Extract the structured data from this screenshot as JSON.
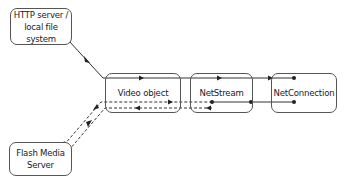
{
  "diagram": {
    "nodes": {
      "http": {
        "label": "HTTP server /\nlocal file system"
      },
      "fms": {
        "label": "Flash Media\nServer"
      },
      "video": {
        "label": "Video object"
      },
      "netstream": {
        "label": "NetStream"
      },
      "netconnection": {
        "label": "NetConnection"
      }
    },
    "edges": [
      {
        "from": "http",
        "to": "video",
        "style": "solid",
        "direction": "forward"
      },
      {
        "from": "video",
        "to": "netstream",
        "style": "solid",
        "direction": "forward"
      },
      {
        "from": "netstream",
        "to": "netconnection",
        "style": "solid",
        "direction": "forward"
      },
      {
        "from": "netconnection",
        "to": "netstream",
        "style": "solid",
        "direction": "return"
      },
      {
        "from": "fms",
        "to": "video",
        "style": "dashed",
        "direction": "forward"
      },
      {
        "from": "video",
        "to": "netstream",
        "style": "dashed",
        "direction": "forward"
      },
      {
        "from": "netstream",
        "to": "video",
        "style": "dashed",
        "direction": "return"
      },
      {
        "from": "video",
        "to": "fms",
        "style": "dashed",
        "direction": "return"
      }
    ],
    "colors": {
      "line": "#333333",
      "border": "#555555",
      "text": "#222222"
    }
  }
}
